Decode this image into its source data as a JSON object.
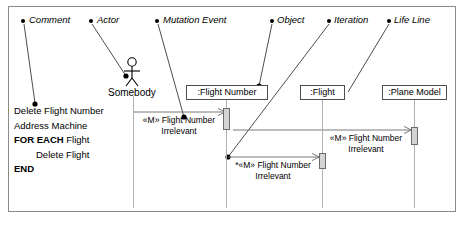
{
  "diagram": {
    "callouts": [
      {
        "id": "comment",
        "label": "Comment"
      },
      {
        "id": "actor",
        "label": "Actor"
      },
      {
        "id": "mutation-event",
        "label": "Mutation Event"
      },
      {
        "id": "object",
        "label": "Object"
      },
      {
        "id": "iteration",
        "label": "Iteration"
      },
      {
        "id": "life-line",
        "label": "Life Line"
      }
    ],
    "actor": {
      "name": "Somebody"
    },
    "objects": [
      {
        "id": "flight-number",
        "label": ":Flight Number"
      },
      {
        "id": "flight",
        "label": ":Flight"
      },
      {
        "id": "plane-model",
        "label": ":Plane Model"
      }
    ],
    "comment_block": {
      "lines": [
        {
          "text": "Delete Flight Number",
          "bold": "",
          "indent": false
        },
        {
          "text": "Address Machine",
          "bold": "",
          "indent": false
        },
        {
          "text": " Flight",
          "bold": "FOR EACH",
          "indent": false
        },
        {
          "text": "Delete Flight",
          "bold": "",
          "indent": true
        },
        {
          "text": "",
          "bold": "END",
          "indent": false
        }
      ],
      "line1": "Delete Flight Number",
      "line2": "Address Machine",
      "line3_bold": "FOR EACH",
      "line3_rest": " Flight",
      "line4": "Delete Flight",
      "line5_bold": "END"
    },
    "messages": [
      {
        "id": "msg-1",
        "line1": "«M» Flight Number",
        "line2": "Irrelevant"
      },
      {
        "id": "msg-2",
        "line1": "«M» Flight Number",
        "line2": "Irrelevant"
      },
      {
        "id": "msg-3",
        "line1": "*«M» Flight Number",
        "line2": "Irrelevant"
      }
    ],
    "colors": {
      "frame_border": "#8c8c8c",
      "lifeline": "#b0b0b0",
      "activation_fill": "#d4d4d4",
      "activation_border": "#6a6a6a",
      "box_border": "#4d4d4d",
      "ink": "#000000",
      "background": "#ffffff"
    }
  }
}
